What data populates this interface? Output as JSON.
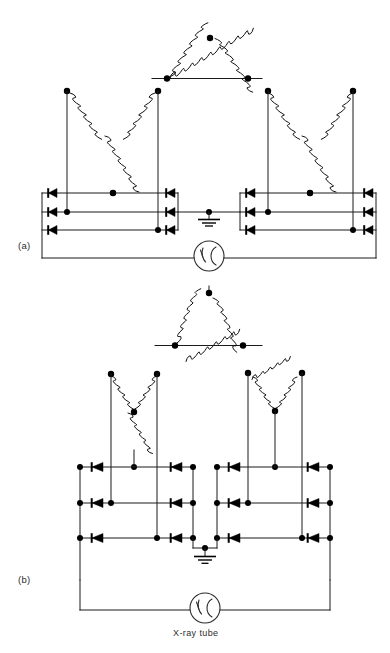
{
  "figure": {
    "background_color": "#ffffff",
    "line_color": "#1b1b1b",
    "node_color": "#000000",
    "panels": [
      {
        "id": "a",
        "label": "(a)",
        "primary_winding": "delta",
        "secondary_left": "wye",
        "secondary_right": "wye",
        "rectifier_phases": 3,
        "diode_count": 12,
        "load_label": "",
        "ground": "center-tap-earth"
      },
      {
        "id": "b",
        "label": "(b)",
        "primary_winding": "delta",
        "secondary_left": "wye",
        "secondary_right": "delta",
        "rectifier_phases": 3,
        "diode_count": 12,
        "load_label": "X-ray tube",
        "ground": "center-tap-earth"
      }
    ],
    "load_name": "X-ray tube",
    "icons": {
      "ground": "earth-ground-icon",
      "diode": "diode-icon",
      "coil": "inductor-coil-icon",
      "tube": "x-ray-tube-icon",
      "junction": "junction-dot-icon"
    }
  }
}
